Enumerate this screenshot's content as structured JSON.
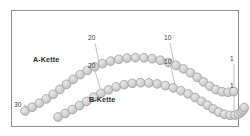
{
  "figure": {
    "background_color": "#ffffff",
    "frame_color": "#8d9094",
    "bead_fill": "#d0d0d0",
    "bead_stroke": "#9a9a9a",
    "leader_color": "#9a9a9a",
    "text_color": "#2b2b2b"
  },
  "labels": {
    "chain_a": "A-Kette",
    "chain_b": "B-Kette"
  },
  "residue_numbers": {
    "a_chain": {
      "start": "30",
      "mid_left": "20",
      "mid_right": "10",
      "end": "1"
    },
    "b_chain": {
      "mid_left": "20",
      "mid_right": "10",
      "end": "1"
    }
  },
  "chart_data": {
    "type": "scatter",
    "xlabel": "",
    "ylabel": "",
    "grid": false,
    "legend": "inline-annotations",
    "xlim": [
      0,
      250
    ],
    "ylim": [
      0,
      136
    ],
    "series": [
      {
        "name": "A-Kette",
        "bead_count": 30,
        "marker": "circle",
        "marker_fill": "#d0d0d0",
        "marker_stroke": "#9a9a9a",
        "marker_radius": 4.4,
        "numbering_direction": "30-to-1",
        "points": [
          [
            25.0,
            111.0
          ],
          [
            32.2,
            107.2
          ],
          [
            39.3,
            103.2
          ],
          [
            46.3,
            98.9
          ],
          [
            53.2,
            94.3
          ],
          [
            59.9,
            89.4
          ],
          [
            66.5,
            84.3
          ],
          [
            73.2,
            79.3
          ],
          [
            80.1,
            74.6
          ],
          [
            87.3,
            70.4
          ],
          [
            94.8,
            66.7
          ],
          [
            102.6,
            63.6
          ],
          [
            110.6,
            61.1
          ],
          [
            118.8,
            59.3
          ],
          [
            127.1,
            58.1
          ],
          [
            135.5,
            57.6
          ],
          [
            143.9,
            57.8
          ],
          [
            152.2,
            58.7
          ],
          [
            160.4,
            60.3
          ],
          [
            168.4,
            62.5
          ],
          [
            176.1,
            65.4
          ],
          [
            183.5,
            68.9
          ],
          [
            190.5,
            72.9
          ],
          [
            197.2,
            77.3
          ],
          [
            203.6,
            81.9
          ],
          [
            209.8,
            86.2
          ],
          [
            215.9,
            89.6
          ],
          [
            222.0,
            91.7
          ],
          [
            228.1,
            92.3
          ],
          [
            233.8,
            91.6
          ]
        ]
      },
      {
        "name": "B-Kette",
        "bead_count": 30,
        "marker": "circle",
        "marker_fill": "#d0d0d0",
        "marker_stroke": "#9a9a9a",
        "marker_radius": 4.4,
        "numbering_direction": "30-to-1",
        "points": [
          [
            58.0,
            117.0
          ],
          [
            65.2,
            113.4
          ],
          [
            72.4,
            109.6
          ],
          [
            79.5,
            105.6
          ],
          [
            86.6,
            101.4
          ],
          [
            93.7,
            97.2
          ],
          [
            101.0,
            93.3
          ],
          [
            108.5,
            89.8
          ],
          [
            116.2,
            86.9
          ],
          [
            124.2,
            84.7
          ],
          [
            132.3,
            83.3
          ],
          [
            140.6,
            82.7
          ],
          [
            148.9,
            82.9
          ],
          [
            157.2,
            83.9
          ],
          [
            165.3,
            85.6
          ],
          [
            173.2,
            87.9
          ],
          [
            180.9,
            90.7
          ],
          [
            188.2,
            93.9
          ],
          [
            195.1,
            97.5
          ],
          [
            201.5,
            101.3
          ],
          [
            207.5,
            105.2
          ],
          [
            213.2,
            108.9
          ],
          [
            218.8,
            112.1
          ],
          [
            224.5,
            114.3
          ],
          [
            230.2,
            115.3
          ],
          [
            235.0,
            115.1
          ],
          [
            238.6,
            114.0
          ],
          [
            241.2,
            112.2
          ],
          [
            243.0,
            110.0
          ],
          [
            244.2,
            107.6
          ]
        ]
      }
    ],
    "annotations": [
      {
        "text": "A-Kette",
        "x": 33,
        "y": 58,
        "kind": "chain-name"
      },
      {
        "text": "B-Kette",
        "x": 89,
        "y": 98,
        "kind": "chain-name"
      },
      {
        "text": "30",
        "x": 17,
        "y": 104,
        "kind": "residue-number",
        "series": "A-Kette"
      },
      {
        "text": "20",
        "x": 91,
        "y": 37,
        "kind": "residue-number",
        "series": "A-Kette"
      },
      {
        "text": "10",
        "x": 167,
        "y": 37,
        "kind": "residue-number",
        "series": "A-Kette"
      },
      {
        "text": "1",
        "x": 233,
        "y": 58,
        "kind": "residue-number",
        "series": "A-Kette"
      },
      {
        "text": "20",
        "x": 91,
        "y": 65,
        "kind": "residue-number",
        "series": "B-Kette"
      },
      {
        "text": "10",
        "x": 167,
        "y": 61,
        "kind": "residue-number",
        "series": "B-Kette"
      },
      {
        "text": "1",
        "x": 233,
        "y": 85,
        "kind": "residue-number",
        "series": "B-Kette"
      }
    ],
    "leaders": [
      {
        "from": [
          24,
          105
        ],
        "to": [
          31,
          109
        ],
        "series": "A-Kette"
      },
      {
        "from": [
          95,
          43
        ],
        "to": [
          99,
          63
        ],
        "series": "A-Kette"
      },
      {
        "from": [
          170,
          43
        ],
        "to": [
          174,
          63
        ],
        "series": "A-Kette"
      },
      {
        "from": [
          234,
          64
        ],
        "to": [
          234,
          88
        ],
        "series": "A-Kette"
      },
      {
        "from": [
          95,
          71
        ],
        "to": [
          100,
          88
        ],
        "series": "B-Kette"
      },
      {
        "from": [
          171,
          67
        ],
        "to": [
          175,
          85
        ],
        "series": "B-Kette"
      },
      {
        "from": [
          234,
          91
        ],
        "to": [
          234,
          110
        ],
        "series": "B-Kette"
      }
    ]
  }
}
